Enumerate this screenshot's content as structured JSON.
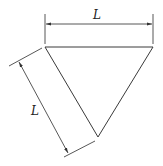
{
  "diagram": {
    "type": "equilateral-triangle-dimensioned",
    "labels": {
      "top_dimension": "L",
      "side_dimension": "L"
    },
    "colors": {
      "stroke": "#3a3a3a",
      "background": "#ffffff"
    }
  }
}
